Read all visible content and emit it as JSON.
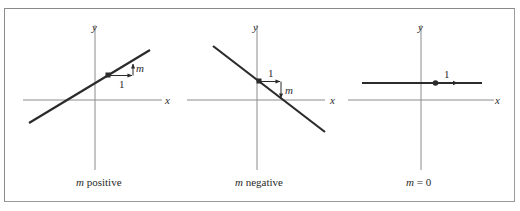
{
  "figure": {
    "panels": [
      {
        "id": "positive",
        "caption_var": "m",
        "caption_rest": " positive",
        "axis_x_label": "x",
        "axis_y_label": "y",
        "run_label": "1",
        "rise_label": "m"
      },
      {
        "id": "negative",
        "caption_var": "m",
        "caption_rest": " negative",
        "axis_x_label": "x",
        "axis_y_label": "y",
        "run_label": "1",
        "rise_label": "m"
      },
      {
        "id": "zero",
        "caption_var": "m",
        "caption_rest": " = 0",
        "axis_x_label": "x",
        "axis_y_label": "y",
        "run_label": "1"
      }
    ],
    "colors": {
      "line": "#2b2b2b",
      "axis": "#8c8c8c",
      "border": "#8a8a8a",
      "text": "#2a2a2a"
    }
  }
}
